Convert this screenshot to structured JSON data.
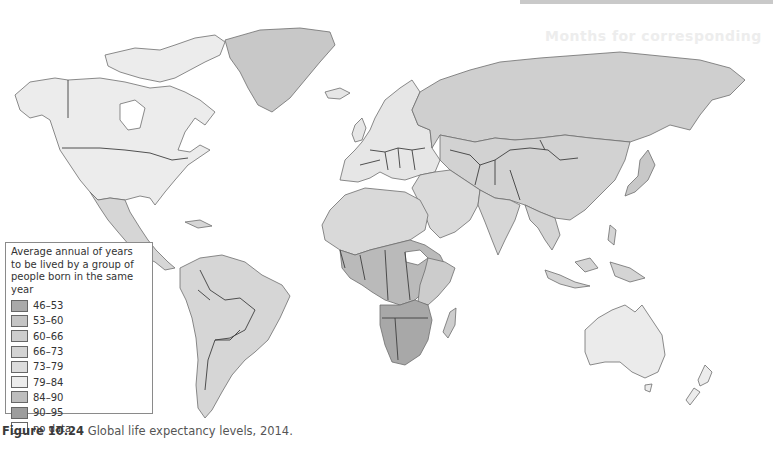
{
  "figure": {
    "caption_number": "Figure 10.24",
    "caption_text": " Global life expectancy levels, 2014.",
    "ghost_header": "Months for corresponding"
  },
  "legend": {
    "title_lines": [
      "Average annual of years",
      "to be lived by a group of",
      "people born in the same year"
    ],
    "items": [
      {
        "label": "46–53",
        "color": "#a9a9a9"
      },
      {
        "label": "53–60",
        "color": "#c4c4c4"
      },
      {
        "label": "60–66",
        "color": "#cdcdcd"
      },
      {
        "label": "66–73",
        "color": "#d3d3d3"
      },
      {
        "label": "73–79",
        "color": "#dcdcdc"
      },
      {
        "label": "79–84",
        "color": "#ececec"
      },
      {
        "label": "84–90",
        "color": "#bdbdbd"
      },
      {
        "label": "90–95",
        "color": "#9d9d9d"
      },
      {
        "label": "no data",
        "color": "#ffffff"
      }
    ]
  },
  "map": {
    "title": "Global life expectancy levels, 2014",
    "region_colors": {
      "north_america": "#ececec",
      "greenland": "#c8c8c8",
      "mexico_central_america": "#d6d6d6",
      "south_america": "#d6d6d6",
      "europe": "#e6e6e6",
      "russia_asia": "#cfcfcf",
      "middle_east": "#dadada",
      "north_africa": "#d9d9d9",
      "central_africa": "#bababa",
      "southern_africa": "#a8a8a8",
      "south_sudan": "#ffffff",
      "madagascar": "#cdcdcd",
      "south_east_asia": "#d4d4d4",
      "japan": "#c8c8c8",
      "australia": "#ebebeb",
      "new_zealand": "#ececec"
    }
  }
}
